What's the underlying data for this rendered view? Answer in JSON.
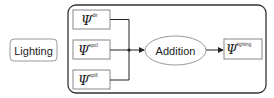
{
  "diagram": {
    "input_node": {
      "label": "Lighting"
    },
    "components": [
      {
        "symbol": "Ψ",
        "superscript": "dir"
      },
      {
        "symbol": "Ψ",
        "superscript": "spcl"
      },
      {
        "symbol": "Ψ",
        "superscript": "spill"
      }
    ],
    "operator": {
      "label": "Addition"
    },
    "output": {
      "symbol": "Ψ",
      "superscript": "lighting"
    },
    "colors": {
      "stroke": "#555555",
      "text": "#222222",
      "background": "#ffffff"
    }
  }
}
